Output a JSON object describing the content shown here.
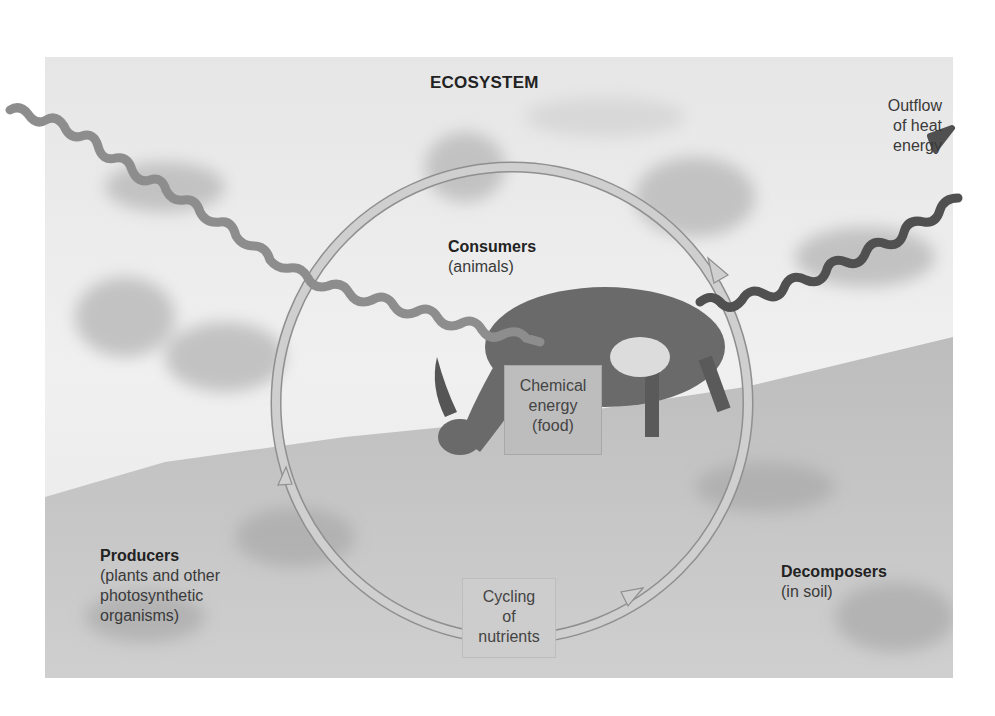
{
  "diagram": {
    "title": "ECOSYSTEM",
    "labels": {
      "outflow": [
        "Outflow",
        "of heat",
        "energy"
      ],
      "consumers": {
        "name": "Consumers",
        "detail": "(animals)"
      },
      "producers": {
        "name": "Producers",
        "detail": [
          "(plants and other",
          "photosynthetic",
          "organisms)"
        ]
      },
      "decomposers": {
        "name": "Decomposers",
        "detail": "(in soil)"
      }
    },
    "boxes": {
      "chemical_energy": [
        "Chemical",
        "energy",
        "(food)"
      ],
      "nutrient_cycling": [
        "Cycling",
        "of",
        "nutrients"
      ]
    },
    "arrows": [
      {
        "name": "energy-inflow",
        "style": "wavy",
        "color": "#8a8a8a",
        "from": "top-left",
        "to": "consumer"
      },
      {
        "name": "heat-outflow",
        "style": "wavy",
        "color": "#555555",
        "from": "consumer",
        "to": "top-right"
      },
      {
        "name": "nutrient-cycle",
        "style": "circular",
        "color": "#c4c4c4",
        "direction": "clockwise"
      }
    ],
    "background": "photo of ibex grazing on alpine grassland with snowy mountains"
  }
}
